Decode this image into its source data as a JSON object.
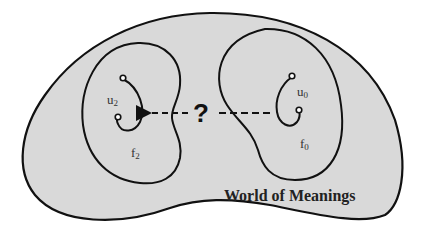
{
  "diagram": {
    "title": "World of Meanings",
    "question_mark": "?",
    "regions": [
      {
        "id": "f2",
        "label_base": "f",
        "label_sub": "2",
        "item_base": "u",
        "item_sub": "2"
      },
      {
        "id": "f0",
        "label_base": "f",
        "label_sub": "0",
        "item_base": "u",
        "item_sub": "0"
      }
    ],
    "arrow": {
      "from": "u0",
      "to": "u2",
      "style": "dashed"
    },
    "colors": {
      "background": "#ffffff",
      "world_fill": "#d9d9d9",
      "stroke": "#111111"
    }
  }
}
